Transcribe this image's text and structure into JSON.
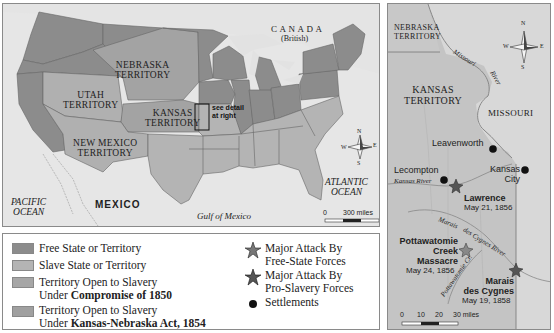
{
  "main_map": {
    "labels": {
      "canada": "CANADA",
      "canada_sub": "(British)",
      "nebraska": "NEBRASKA TERRITORY",
      "nebraska_l1": "NEBRASKA",
      "nebraska_l2": "TERRITORY",
      "utah_l1": "UTAH",
      "utah_l2": "TERRITORY",
      "kansas_l1": "KANSAS",
      "kansas_l2": "TERRITORY",
      "newmexico_l1": "NEW MEXICO",
      "newmexico_l2": "TERRITORY",
      "see_detail_l1": "see detail",
      "see_detail_l2": "at right",
      "pacific_l1": "PACIFIC",
      "pacific_l2": "OCEAN",
      "mexico": "MEXICO",
      "gulf": "Gulf of Mexico",
      "atlantic_l1": "ATLANTIC",
      "atlantic_l2": "OCEAN"
    },
    "compass": {
      "n": "N",
      "s": "S",
      "e": "E",
      "w": "W"
    },
    "scale": {
      "start": "0",
      "end": "300 miles"
    }
  },
  "detail_map": {
    "labels": {
      "nebraska_l1": "NEBRASKA",
      "nebraska_l2": "TERRITORY",
      "kansas_l1": "KANSAS",
      "kansas_l2": "TERRITORY",
      "missouri": "MISSOURI",
      "missouri_river_1": "Missouri",
      "missouri_river_2": "River",
      "kansas_river": "Kansas River",
      "marais_river_1": "Marais",
      "marais_river_2": "des Cygnes River",
      "pottawatomie_cr": "Pottawatomie Cr."
    },
    "settlements": [
      {
        "name": "Leavenworth"
      },
      {
        "name": "Lecompton"
      },
      {
        "name": "Kansas",
        "name2": "City"
      }
    ],
    "attacks": [
      {
        "name": "Lawrence",
        "date": "May 21, 1856"
      },
      {
        "name_l1": "Pottawatomie",
        "name_l2": "Creek",
        "name_l3": "Massacre",
        "date": "May 24, 1856"
      },
      {
        "name_l1": "Marais",
        "name_l2": "des Cygnes",
        "date": "May 19, 1858"
      }
    ],
    "compass": {
      "n": "N",
      "s": "S",
      "e": "E",
      "w": "W"
    },
    "scale": {
      "t0": "0",
      "t1": "10",
      "t2": "20",
      "t3": "30 miles"
    }
  },
  "legend": {
    "items": [
      {
        "label": "Free State or Territory",
        "color": "#8c8c8c"
      },
      {
        "label": "Slave State or Territory",
        "color": "#b4b4b4"
      },
      {
        "label_l1": "Territory Open to Slavery",
        "label_l2_pre": "Under ",
        "label_l2_bold": "Compromise of 1850",
        "color": "#a6a6a6"
      },
      {
        "label_l1": "Territory Open to Slavery",
        "label_l2_pre": "Under ",
        "label_l2_bold": "Kansas-Nebraska Act, 1854",
        "color": "#a0a0a0"
      }
    ],
    "symbols": [
      {
        "label_l1": "Major Attack By",
        "label_l2": "Free-State Forces"
      },
      {
        "label_l1": "Major Attack By",
        "label_l2": "Pro-Slavery Forces"
      },
      {
        "label": "Settlements"
      }
    ]
  },
  "colors": {
    "free": "#8c8c8c",
    "slave": "#b4b4b4",
    "territory": "#a5a5a5",
    "water": "#e6e6e6",
    "border": "#555555"
  }
}
